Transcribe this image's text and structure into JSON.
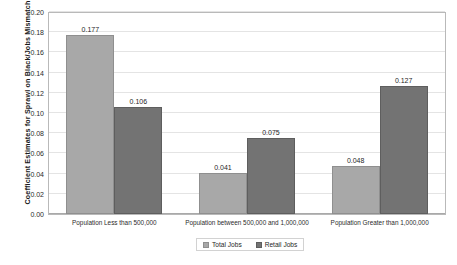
{
  "chart_data": {
    "type": "bar",
    "title": "",
    "xlabel": "",
    "ylabel": "Coefficient Estimates for Sprawl on Black/Jobs Mismatch",
    "ylim": [
      0.0,
      0.2
    ],
    "ytick_step": 0.02,
    "yticks": [
      "0.20",
      "0.18",
      "0.16",
      "0.14",
      "0.12",
      "0.10",
      "0.08",
      "0.06",
      "0.04",
      "0.02",
      "0.00"
    ],
    "grid": true,
    "legend_position": "bottom-center",
    "categories": [
      "Population Less than 500,000",
      "Population between 500,000 and 1,000,000",
      "Population Greater than 1,000,000"
    ],
    "series": [
      {
        "name": "Total Jobs",
        "color": "#a8a8a8",
        "values": [
          0.177,
          0.041,
          0.048
        ],
        "labels": [
          "0.177",
          "0.041",
          "0.048"
        ]
      },
      {
        "name": "Retail Jobs",
        "color": "#737373",
        "values": [
          0.106,
          0.075,
          0.127
        ],
        "labels": [
          "0.106",
          "0.075",
          "0.127"
        ]
      }
    ]
  },
  "caption_fragment": "partially visible text cut off at the bottom edge"
}
